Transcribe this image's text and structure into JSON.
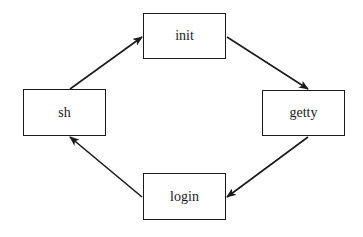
{
  "diagram": {
    "type": "cycle",
    "colors": {
      "stroke": "#1a1a1a",
      "background": "#ffffff"
    },
    "nodes": [
      {
        "id": "init",
        "label": "init",
        "x": 143,
        "y": 13,
        "w": 83,
        "h": 46
      },
      {
        "id": "getty",
        "label": "getty",
        "x": 262,
        "y": 90,
        "w": 83,
        "h": 46
      },
      {
        "id": "login",
        "label": "login",
        "x": 143,
        "y": 173,
        "w": 83,
        "h": 47
      },
      {
        "id": "sh",
        "label": "sh",
        "x": 23,
        "y": 89,
        "w": 83,
        "h": 47
      }
    ],
    "edges": [
      {
        "from": "sh",
        "to": "init",
        "x1": 70,
        "y1": 89,
        "x2": 142,
        "y2": 37
      },
      {
        "from": "init",
        "to": "getty",
        "x1": 227,
        "y1": 37,
        "x2": 308,
        "y2": 89
      },
      {
        "from": "getty",
        "to": "login",
        "x1": 308,
        "y1": 137,
        "x2": 227,
        "y2": 197
      },
      {
        "from": "login",
        "to": "sh",
        "x1": 142,
        "y1": 197,
        "x2": 70,
        "y2": 137
      }
    ]
  }
}
